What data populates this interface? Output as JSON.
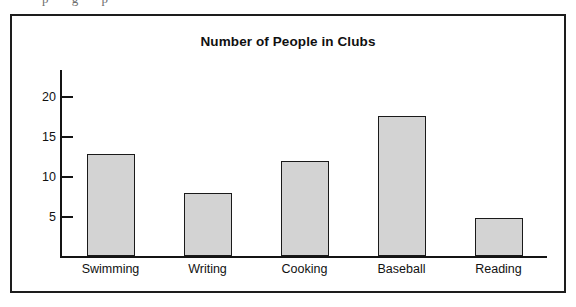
{
  "artifact": {
    "top_fragment_text": "p    g p"
  },
  "figure": {
    "border_color": "#1d1d1d",
    "background_color": "#ffffff"
  },
  "chart_data": {
    "type": "bar",
    "title": "Number of People in Clubs",
    "xlabel": "",
    "ylabel": "",
    "categories": [
      "Swimming",
      "Writing",
      "Cooking",
      "Baseball",
      "Reading"
    ],
    "values": [
      12.7,
      7.9,
      11.9,
      17.5,
      4.7
    ],
    "ylim": [
      0,
      23.5
    ],
    "yticks": [
      5,
      10,
      15,
      20
    ],
    "ytick_labels": [
      "5",
      "10",
      "15",
      "20"
    ],
    "grid": false,
    "legend": null,
    "bar_fill_color": "#d3d3d3",
    "bar_edge_color": "#1a1a1a",
    "axis_color": "#141414"
  }
}
